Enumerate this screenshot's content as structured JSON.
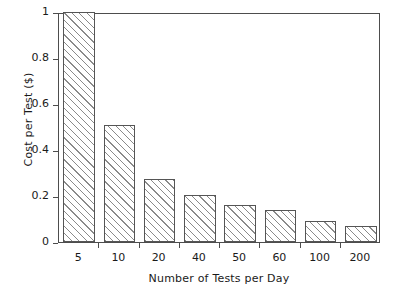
{
  "chart_data": {
    "type": "bar",
    "title": "",
    "xlabel": "Number of Tests per Day",
    "ylabel": "Cost per Test ($)",
    "categories": [
      "5",
      "10",
      "20",
      "40",
      "50",
      "60",
      "100",
      "200"
    ],
    "values": [
      1.0,
      0.51,
      0.275,
      0.205,
      0.16,
      0.14,
      0.09,
      0.07
    ],
    "ylim": [
      0,
      1
    ],
    "ytick_labels": [
      "0",
      "0.2",
      "0.4",
      "0.6",
      "0.8",
      "1"
    ],
    "ytick_values": [
      0,
      0.2,
      0.4,
      0.6,
      0.8,
      1
    ],
    "grid": false,
    "legend": false,
    "bar_fill": "hatched-45deg",
    "bar_edge_color": "#555555",
    "hatch_color": "#8a8a8a",
    "axis_color": "#4d4d4d"
  }
}
